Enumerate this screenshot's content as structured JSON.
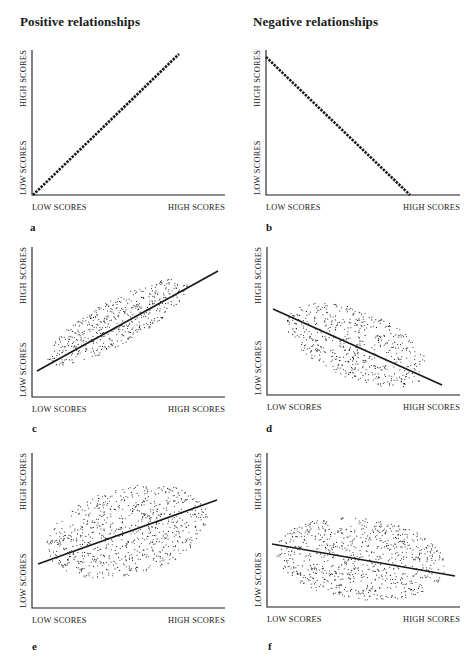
{
  "headings": {
    "left": "Positive relationships",
    "right": "Negative relationships"
  },
  "axis_labels": {
    "x_low": "LOW SCORES",
    "x_high": "HIGH SCORES",
    "y_low": "LOW SCORES",
    "y_high": "HIGH SCORES"
  },
  "colors": {
    "ink": "#1a1a1a",
    "background": "#ffffff"
  },
  "chart_data": [
    {
      "id": "a",
      "letter": "a",
      "type": "scatter",
      "relationship": "positive",
      "strength": "perfect",
      "title": "",
      "xlabel": "LOW SCORES → HIGH SCORES",
      "ylabel": "LOW SCORES → HIGH SCORES",
      "axis": {
        "x0": 32,
        "y0": 195,
        "x1": 225,
        "y1": 50
      },
      "line": {
        "x1": 33,
        "y1": 195,
        "x2": 179,
        "y2": 54,
        "dotted": true
      },
      "cloud": null,
      "letter_pos": {
        "x": 30,
        "y": 231
      }
    },
    {
      "id": "b",
      "letter": "b",
      "type": "scatter",
      "relationship": "negative",
      "strength": "perfect",
      "title": "",
      "xlabel": "LOW SCORES → HIGH SCORES",
      "ylabel": "LOW SCORES → HIGH SCORES",
      "axis": {
        "x0": 266,
        "y0": 195,
        "x1": 460,
        "y1": 50
      },
      "line": {
        "x1": 266,
        "y1": 57,
        "x2": 410,
        "y2": 195,
        "dotted": true
      },
      "cloud": null,
      "letter_pos": {
        "x": 266,
        "y": 231
      }
    },
    {
      "id": "c",
      "letter": "c",
      "type": "scatter",
      "relationship": "positive",
      "strength": "strong",
      "title": "",
      "xlabel": "LOW SCORES → HIGH SCORES",
      "ylabel": "LOW SCORES → HIGH SCORES",
      "axis": {
        "x0": 32,
        "y0": 397,
        "x1": 225,
        "y1": 247
      },
      "line": {
        "x1": 37,
        "y1": 371,
        "x2": 218,
        "y2": 271,
        "dotted": false
      },
      "cloud": {
        "cx": 117,
        "cy": 322,
        "rx": 80,
        "ry": 22,
        "angle": -29,
        "n": 520,
        "seed": 11
      },
      "letter_pos": {
        "x": 32,
        "y": 432
      }
    },
    {
      "id": "d",
      "letter": "d",
      "type": "scatter",
      "relationship": "negative",
      "strength": "moderate",
      "title": "",
      "xlabel": "LOW SCORES → HIGH SCORES",
      "ylabel": "LOW SCORES → HIGH SCORES",
      "axis": {
        "x0": 267,
        "y0": 395,
        "x1": 460,
        "y1": 247
      },
      "line": {
        "x1": 273,
        "y1": 309,
        "x2": 442,
        "y2": 385,
        "dotted": false
      },
      "cloud": {
        "cx": 357,
        "cy": 345,
        "rx": 75,
        "ry": 34,
        "angle": 22,
        "n": 560,
        "seed": 23
      },
      "letter_pos": {
        "x": 266,
        "y": 432
      }
    },
    {
      "id": "e",
      "letter": "e",
      "type": "scatter",
      "relationship": "positive",
      "strength": "weak",
      "title": "",
      "xlabel": "LOW SCORES → HIGH SCORES",
      "ylabel": "LOW SCORES → HIGH SCORES",
      "axis": {
        "x0": 32,
        "y0": 608,
        "x1": 225,
        "y1": 453
      },
      "line": {
        "x1": 38,
        "y1": 564,
        "x2": 217,
        "y2": 500,
        "dotted": false
      },
      "cloud": {
        "cx": 127,
        "cy": 532,
        "rx": 82,
        "ry": 44,
        "angle": -14,
        "n": 820,
        "seed": 37
      },
      "letter_pos": {
        "x": 32,
        "y": 650
      }
    },
    {
      "id": "f",
      "letter": "f",
      "type": "scatter",
      "relationship": "negative",
      "strength": "weak",
      "title": "",
      "xlabel": "LOW SCORES → HIGH SCORES",
      "ylabel": "LOW SCORES → HIGH SCORES",
      "axis": {
        "x0": 267,
        "y0": 607,
        "x1": 460,
        "y1": 453
      },
      "line": {
        "x1": 272,
        "y1": 544,
        "x2": 455,
        "y2": 576,
        "dotted": false
      },
      "cloud": {
        "cx": 361,
        "cy": 559,
        "rx": 85,
        "ry": 41,
        "angle": 6,
        "n": 820,
        "seed": 53
      },
      "letter_pos": {
        "x": 268,
        "y": 650
      }
    }
  ]
}
